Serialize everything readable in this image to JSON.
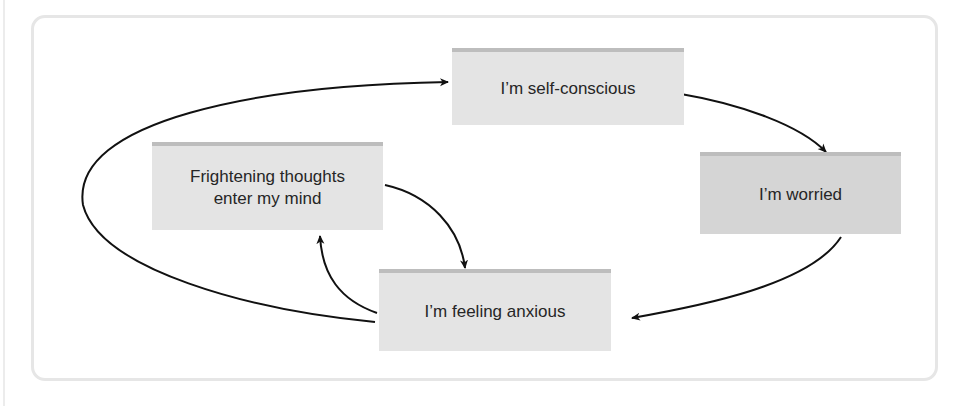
{
  "diagram": {
    "type": "cycle",
    "nodes": [
      {
        "id": "self_conscious",
        "label": "I’m self-conscious"
      },
      {
        "id": "worried",
        "label": "I’m worried"
      },
      {
        "id": "anxious",
        "label": "I’m feeling anxious"
      },
      {
        "id": "frightening",
        "label": "Frightening thoughts enter my mind"
      }
    ],
    "edges": [
      {
        "from": "self_conscious",
        "to": "worried"
      },
      {
        "from": "worried",
        "to": "anxious"
      },
      {
        "from": "anxious",
        "to": "self_conscious"
      },
      {
        "from": "anxious",
        "to": "frightening"
      },
      {
        "from": "frightening",
        "to": "anxious"
      }
    ],
    "colors": {
      "node_fill": "#e4e4e4",
      "node_fill_dark": "#d5d5d5",
      "node_top_bar": "#bdbdbd",
      "arrow": "#111111",
      "frame": "#e6e6e6"
    }
  }
}
